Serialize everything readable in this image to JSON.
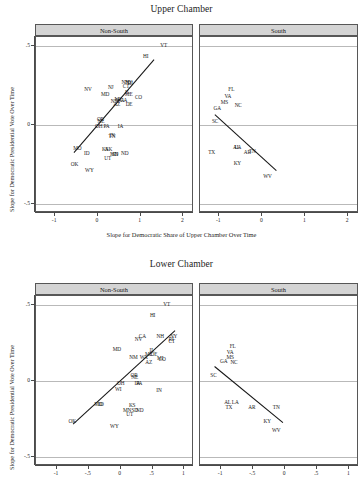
{
  "figures": [
    {
      "id": "upper-chamber",
      "title": "Upper Chamber",
      "xlabel": "Slope for Democratic Share of Upper Chamber Over Time",
      "ylabel": "Slope for Democratic Presidential Vote Over Time",
      "xticks": [
        "-1",
        "0",
        "1",
        "2"
      ],
      "yticks": [
        ".5",
        "0",
        "-.5"
      ],
      "panels": [
        {
          "id": "non-south",
          "label": "Non-South"
        },
        {
          "id": "south",
          "label": "South"
        }
      ]
    },
    {
      "id": "lower-chamber",
      "title": "Lower Chamber",
      "xlabel": "",
      "ylabel": "Slope for Democratic Presidential Vote Over Time",
      "xticks": [
        "-1",
        "-.5",
        "0",
        ".5",
        "1"
      ],
      "yticks": [
        ".5",
        "0",
        "-.5"
      ],
      "panels": [
        {
          "id": "non-south",
          "label": "Non-South"
        },
        {
          "id": "south",
          "label": "South"
        }
      ]
    }
  ],
  "chart_data": [
    {
      "type": "scatter",
      "title": "Upper Chamber",
      "xlabel": "Slope for Democratic Share of Upper Chamber Over Time",
      "ylabel": "Slope for Democratic Presidential Vote Over Time",
      "xlim": [
        -1.45,
        2.25
      ],
      "ylim": [
        -0.56,
        0.56
      ],
      "xticks": [
        -1,
        0,
        1,
        2
      ],
      "yticks": [
        0.5,
        0,
        -0.5
      ],
      "grid": "horizontal gridlines at y = .5, 0, -.5",
      "legend": "none",
      "facets": [
        {
          "name": "Non-South",
          "points": [
            {
              "label": "VT",
              "x": 1.54,
              "y": 0.5
            },
            {
              "label": "HI",
              "x": 1.12,
              "y": 0.43
            },
            {
              "label": "NY",
              "x": 0.72,
              "y": 0.268
            },
            {
              "label": "NH",
              "x": 0.64,
              "y": 0.268
            },
            {
              "label": "RI",
              "x": 0.76,
              "y": 0.262
            },
            {
              "label": "CT",
              "x": 0.66,
              "y": 0.24
            },
            {
              "label": "NJ",
              "x": 0.3,
              "y": 0.236
            },
            {
              "label": "NV",
              "x": -0.23,
              "y": 0.225
            },
            {
              "label": "IL",
              "x": 0.69,
              "y": 0.205
            },
            {
              "label": "ME",
              "x": 0.72,
              "y": 0.19
            },
            {
              "label": "MD",
              "x": 0.17,
              "y": 0.19
            },
            {
              "label": "CO",
              "x": 0.95,
              "y": 0.172
            },
            {
              "label": "MI",
              "x": 0.46,
              "y": 0.162
            },
            {
              "label": "WA",
              "x": 0.52,
              "y": 0.155
            },
            {
              "label": "CA",
              "x": 0.6,
              "y": 0.152
            },
            {
              "label": "NM",
              "x": 0.4,
              "y": 0.145
            },
            {
              "label": "AZ",
              "x": 0.44,
              "y": 0.13
            },
            {
              "label": "DE",
              "x": 0.73,
              "y": 0.128
            },
            {
              "label": "OR",
              "x": 0.06,
              "y": 0.035
            },
            {
              "label": "NE",
              "x": 0.07,
              "y": 0.022
            },
            {
              "label": "OH",
              "x": 0.02,
              "y": -0.012
            },
            {
              "label": "PA",
              "x": 0.2,
              "y": -0.012
            },
            {
              "label": "IA",
              "x": 0.53,
              "y": -0.015
            },
            {
              "label": "IN",
              "x": 0.33,
              "y": -0.068
            },
            {
              "label": "TN",
              "x": 0.33,
              "y": -0.075
            },
            {
              "label": "MO",
              "x": -0.48,
              "y": -0.152
            },
            {
              "label": "KS",
              "x": 0.17,
              "y": -0.16
            },
            {
              "label": "AK",
              "x": 0.25,
              "y": -0.158
            },
            {
              "label": "ID",
              "x": -0.26,
              "y": -0.182
            },
            {
              "label": "MN",
              "x": 0.38,
              "y": -0.188
            },
            {
              "label": "SD",
              "x": 0.4,
              "y": -0.188
            },
            {
              "label": "ND",
              "x": 0.63,
              "y": -0.185
            },
            {
              "label": "UT",
              "x": 0.23,
              "y": -0.215
            },
            {
              "label": "OK",
              "x": -0.55,
              "y": -0.252
            },
            {
              "label": "WY",
              "x": -0.2,
              "y": -0.29
            }
          ],
          "fit_line": {
            "x0": -0.55,
            "y0": -0.185,
            "x1": 1.35,
            "y1": 0.415,
            "direction": "positive"
          }
        },
        {
          "name": "South",
          "points": [
            {
              "label": "FL",
              "x": -0.72,
              "y": 0.225
            },
            {
              "label": "VA",
              "x": -0.8,
              "y": 0.18
            },
            {
              "label": "MS",
              "x": -0.88,
              "y": 0.14
            },
            {
              "label": "NC",
              "x": -0.56,
              "y": 0.118
            },
            {
              "label": "GA",
              "x": -1.05,
              "y": 0.105
            },
            {
              "label": "SC",
              "x": -1.1,
              "y": 0.022
            },
            {
              "label": "AL",
              "x": -0.6,
              "y": -0.148
            },
            {
              "label": "LA",
              "x": -0.57,
              "y": -0.148
            },
            {
              "label": "TX",
              "x": -1.18,
              "y": -0.175
            },
            {
              "label": "AR",
              "x": -0.35,
              "y": -0.178
            },
            {
              "label": "TN",
              "x": -0.23,
              "y": -0.172
            },
            {
              "label": "KY",
              "x": -0.58,
              "y": -0.248
            },
            {
              "label": "WV",
              "x": 0.12,
              "y": -0.33
            }
          ],
          "fit_line": {
            "x0": -1.1,
            "y0": 0.06,
            "x1": 0.35,
            "y1": -0.3,
            "direction": "negative"
          }
        }
      ]
    },
    {
      "type": "scatter",
      "title": "Lower Chamber",
      "xlabel": "",
      "ylabel": "Slope for Democratic Presidential Vote Over Time",
      "xlim": [
        -1.33,
        1.15
      ],
      "ylim": [
        -0.56,
        0.56
      ],
      "xticks": [
        -1,
        -0.5,
        0,
        0.5,
        1
      ],
      "yticks": [
        0.5,
        0,
        -0.5
      ],
      "grid": "horizontal gridlines at y = .5, 0, -.5",
      "legend": "none",
      "facets": [
        {
          "name": "Non-South",
          "points": [
            {
              "label": "VT",
              "x": 0.72,
              "y": 0.5
            },
            {
              "label": "HI",
              "x": 0.5,
              "y": 0.43
            },
            {
              "label": "NY",
              "x": 0.83,
              "y": 0.292
            },
            {
              "label": "NH",
              "x": 0.62,
              "y": 0.29
            },
            {
              "label": "CA",
              "x": 0.34,
              "y": 0.288
            },
            {
              "label": "NV",
              "x": 0.28,
              "y": 0.268
            },
            {
              "label": "RI",
              "x": 0.79,
              "y": 0.268
            },
            {
              "label": "CT",
              "x": 0.8,
              "y": 0.255
            },
            {
              "label": "MD",
              "x": -0.06,
              "y": 0.205
            },
            {
              "label": "IL",
              "x": 0.49,
              "y": 0.198
            },
            {
              "label": "ME",
              "x": 0.44,
              "y": 0.172
            },
            {
              "label": "DE",
              "x": 0.52,
              "y": 0.172
            },
            {
              "label": "NM",
              "x": 0.2,
              "y": 0.15
            },
            {
              "label": "WA",
              "x": 0.36,
              "y": 0.15
            },
            {
              "label": "MI",
              "x": 0.62,
              "y": 0.145
            },
            {
              "label": "CO",
              "x": 0.65,
              "y": 0.14
            },
            {
              "label": "AZ",
              "x": 0.44,
              "y": 0.118
            },
            {
              "label": "OR",
              "x": 0.21,
              "y": 0.035
            },
            {
              "label": "NE",
              "x": 0.22,
              "y": 0.022
            },
            {
              "label": "OH",
              "x": 0.0,
              "y": -0.02
            },
            {
              "label": "IA",
              "x": 0.26,
              "y": -0.018
            },
            {
              "label": "PA",
              "x": 0.29,
              "y": -0.018
            },
            {
              "label": "WI",
              "x": -0.04,
              "y": -0.062
            },
            {
              "label": "IN",
              "x": 0.6,
              "y": -0.068
            },
            {
              "label": "MO",
              "x": -0.35,
              "y": -0.16
            },
            {
              "label": "ID",
              "x": -0.31,
              "y": -0.16
            },
            {
              "label": "KS",
              "x": 0.18,
              "y": -0.165
            },
            {
              "label": "MN",
              "x": 0.1,
              "y": -0.195
            },
            {
              "label": "SD",
              "x": 0.22,
              "y": -0.195
            },
            {
              "label": "ND",
              "x": 0.3,
              "y": -0.195
            },
            {
              "label": "UT",
              "x": 0.14,
              "y": -0.225
            },
            {
              "label": "OK",
              "x": -0.76,
              "y": -0.268
            },
            {
              "label": "WY",
              "x": -0.1,
              "y": -0.3
            }
          ],
          "fit_line": {
            "x0": -0.74,
            "y0": -0.295,
            "x1": 0.88,
            "y1": 0.33,
            "direction": "positive"
          }
        },
        {
          "name": "South",
          "points": [
            {
              "label": "FL",
              "x": -0.82,
              "y": 0.225
            },
            {
              "label": "VA",
              "x": -0.86,
              "y": 0.185
            },
            {
              "label": "MS",
              "x": -0.86,
              "y": 0.152
            },
            {
              "label": "GA",
              "x": -0.96,
              "y": 0.125
            },
            {
              "label": "NC",
              "x": -0.8,
              "y": 0.118
            },
            {
              "label": "SC",
              "x": -1.12,
              "y": 0.032
            },
            {
              "label": "AL",
              "x": -0.9,
              "y": -0.148
            },
            {
              "label": "LA",
              "x": -0.78,
              "y": -0.148
            },
            {
              "label": "TX",
              "x": -0.88,
              "y": -0.18
            },
            {
              "label": "AR",
              "x": -0.52,
              "y": -0.18
            },
            {
              "label": "TN",
              "x": -0.14,
              "y": -0.178
            },
            {
              "label": "KY",
              "x": -0.28,
              "y": -0.27
            },
            {
              "label": "WV",
              "x": -0.14,
              "y": -0.33
            }
          ],
          "fit_line": {
            "x0": -1.1,
            "y0": 0.09,
            "x1": -0.02,
            "y1": -0.285,
            "direction": "negative"
          }
        }
      ]
    }
  ]
}
